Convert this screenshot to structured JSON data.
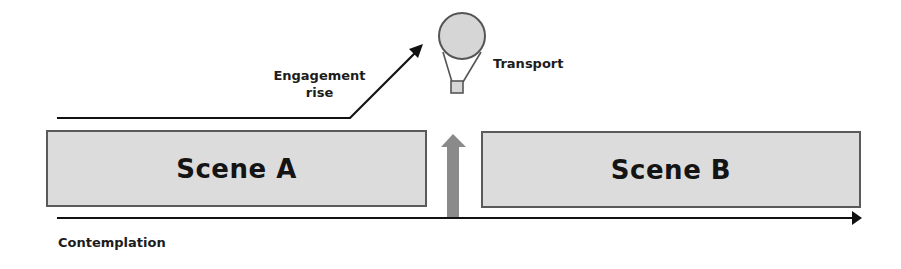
{
  "diagram": {
    "scenes": [
      {
        "id": "scene-a",
        "label": "Scene A"
      },
      {
        "id": "scene-b",
        "label": "Scene B"
      }
    ],
    "engagement_label_line1": "Engagement",
    "engagement_label_line2": "rise",
    "transport_label": "Transport",
    "axis_label": "Contemplation",
    "icons": {
      "balloon": "hot-air-balloon-icon",
      "gap_arrow": "up-arrow-icon"
    },
    "colors": {
      "scene_fill": "#dcdcdc",
      "scene_border": "#5a5a5a",
      "gap_arrow": "#8a8a8a",
      "balloon_fill": "#d6d6d6",
      "line": "#111111"
    }
  }
}
